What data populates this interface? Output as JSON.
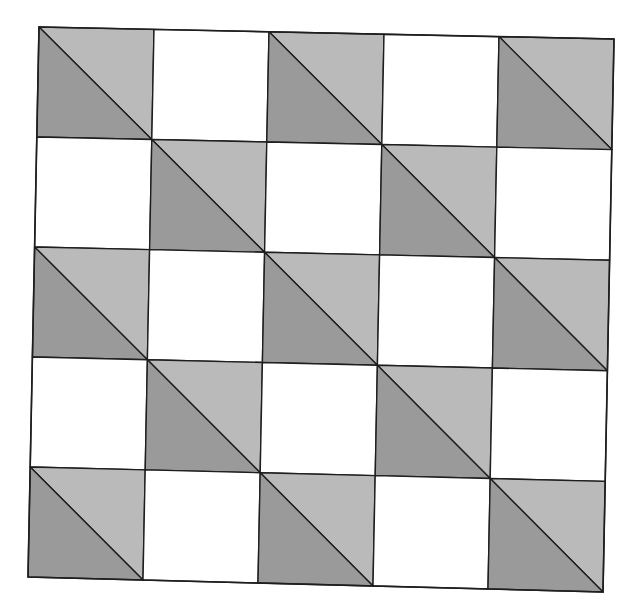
{
  "diagram": {
    "rows": 5,
    "cols": 5,
    "corners": {
      "top_left": [
        39,
        27
      ],
      "top_right": [
        614,
        39
      ],
      "bottom_right": [
        603,
        592
      ],
      "bottom_left": [
        28,
        577
      ]
    },
    "colors": {
      "background": "#ffffff",
      "blank_cell": "#ffffff",
      "light_triangle": "#bababa",
      "dark_triangle": "#9a9a9a",
      "line": "#1e1e1e"
    },
    "pattern_rule": "cell is filled when (row + col) is even; filled cells are split by a diagonal from top-left to bottom-right, upper-right triangle light, lower-left triangle dark",
    "cells": [
      [
        "filled",
        "blank",
        "filled",
        "blank",
        "filled"
      ],
      [
        "blank",
        "filled",
        "blank",
        "filled",
        "blank"
      ],
      [
        "filled",
        "blank",
        "filled",
        "blank",
        "filled"
      ],
      [
        "blank",
        "filled",
        "blank",
        "filled",
        "blank"
      ],
      [
        "filled",
        "blank",
        "filled",
        "blank",
        "filled"
      ]
    ]
  }
}
